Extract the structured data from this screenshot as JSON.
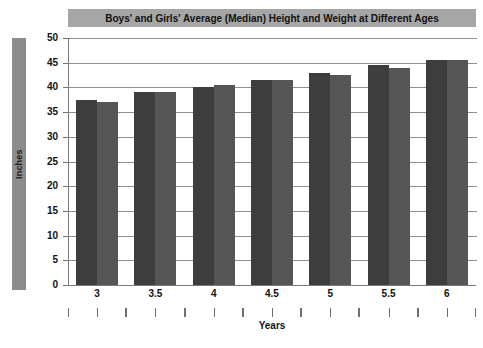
{
  "chart_data": {
    "type": "bar",
    "title": "Boys' and Girls' Average (Median) Height and Weight at Different Ages",
    "xlabel": "Years",
    "ylabel": "Inches",
    "categories": [
      "3",
      "3.5",
      "4",
      "4.5",
      "5",
      "5.5",
      "6"
    ],
    "series": [
      {
        "name": "Boys",
        "color": "#3d3d3d",
        "values": [
          37.5,
          39.0,
          40.0,
          41.5,
          43.0,
          44.5,
          45.5
        ]
      },
      {
        "name": "Girls",
        "color": "#565656",
        "values": [
          37.0,
          39.0,
          40.5,
          41.5,
          42.5,
          44.0,
          45.5
        ]
      }
    ],
    "ylim": [
      0,
      50
    ],
    "ytick_step": 5,
    "yticks": [
      "50",
      "45",
      "40",
      "35",
      "30",
      "25",
      "20",
      "15",
      "10",
      "5",
      "0"
    ],
    "ytick_values": [
      50,
      45,
      40,
      35,
      30,
      25,
      20,
      15,
      10,
      5,
      0
    ],
    "grid": true,
    "grid_axis": "y",
    "legend": "none",
    "legend_position": "none",
    "title_background": "#a6a6a6",
    "ylabel_background": "#8c8c8c",
    "gridline_color": "#8f8f8f",
    "background": "#ffffff"
  }
}
